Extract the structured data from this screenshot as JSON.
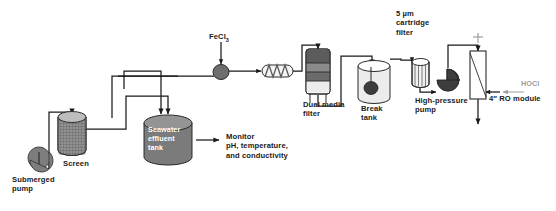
{
  "diagram": {
    "type": "process-flow-diagram",
    "canvas": {
      "width": 556,
      "height": 211
    },
    "colors": {
      "line": "#1a1a1a",
      "equipment_fill_dark": "#6e6e6e",
      "equipment_fill_mid": "#8a8a8a",
      "equipment_fill_light": "#d8d8d8",
      "equipment_fill_pale": "#f2f2f2",
      "text": "#1a1a1a",
      "text_muted": "#9c9c9c",
      "background": "#ffffff"
    }
  },
  "labels": {
    "submerged_pump": "Submerged\npump",
    "screen": "Screen",
    "seawater_effluent_tank": "Seawater\neffluent\ntank",
    "monitor": "Monitor\npH, temperature,\nand conductivity",
    "fecl3_prefix": "FeCl",
    "fecl3_subscript": "3",
    "dual_media_filter": "Dual media\nfilter",
    "break_tank": "Break\ntank",
    "cartridge_filter": "5 µm\ncartridge\nfilter",
    "high_pressure_pump": "High-pressure\npump",
    "hocl": "HOCl",
    "ro_module_size": "4″",
    "ro_module": "4″ RO module"
  },
  "equipment": [
    {
      "id": "submerged-pump",
      "name": "Submerged pump",
      "shape": "teardrop-pump",
      "label": "Submerged\npump"
    },
    {
      "id": "screen",
      "name": "Screen",
      "shape": "mesh-cylinder",
      "label": "Screen"
    },
    {
      "id": "seawater-effluent-tank",
      "name": "Seawater effluent tank",
      "shape": "filled-cylinder",
      "label": "Seawater\neffluent\ntank"
    },
    {
      "id": "dosing-pump",
      "name": "FeCl3 dosing pump",
      "shape": "circle-pump",
      "label": ""
    },
    {
      "id": "static-mixer",
      "name": "Static mixer",
      "shape": "inline-mixer",
      "label": ""
    },
    {
      "id": "dual-media-filter",
      "name": "Dual media filter",
      "shape": "layered-column",
      "label": "Dual media\nfilter"
    },
    {
      "id": "break-tank",
      "name": "Break tank",
      "shape": "open-tank",
      "label": "Break\ntank"
    },
    {
      "id": "cartridge-filter",
      "name": "5 um cartridge filter",
      "shape": "pleated-cartridge",
      "label": "5 µm\ncartridge\nfilter"
    },
    {
      "id": "high-pressure-pump",
      "name": "High-pressure pump",
      "shape": "teardrop-pump",
      "label": "High-pressure\npump"
    },
    {
      "id": "ro-module",
      "name": "4 inch RO module",
      "shape": "membrane-vessel",
      "label": "4″ RO module"
    }
  ],
  "streams": [
    {
      "from": "submerged-pump",
      "to": "screen",
      "label": ""
    },
    {
      "from": "screen",
      "to": "seawater-effluent-tank",
      "label": ""
    },
    {
      "from": "seawater-effluent-tank",
      "to": "monitor",
      "label": "Monitor pH, temperature, and conductivity"
    },
    {
      "from": "seawater-effluent-tank",
      "to": "dosing-pump",
      "label": ""
    },
    {
      "from": "fecl3-dose",
      "to": "dosing-pump",
      "label": "FeCl3"
    },
    {
      "from": "dosing-pump",
      "to": "static-mixer",
      "label": ""
    },
    {
      "from": "static-mixer",
      "to": "dual-media-filter",
      "label": ""
    },
    {
      "from": "dual-media-filter",
      "to": "break-tank",
      "label": ""
    },
    {
      "from": "break-tank",
      "to": "cartridge-filter",
      "label": ""
    },
    {
      "from": "cartridge-filter",
      "to": "high-pressure-pump",
      "label": ""
    },
    {
      "from": "high-pressure-pump",
      "to": "ro-module",
      "label": ""
    },
    {
      "from": "ro-module",
      "to": "permeate",
      "label": "HOCl"
    }
  ]
}
